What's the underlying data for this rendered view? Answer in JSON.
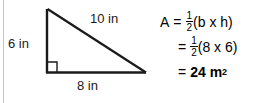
{
  "figure": {
    "shape_name": "right-triangle",
    "labels": {
      "height": "6 in",
      "hypotenuse": "10 in",
      "base": "8 in"
    },
    "right_angle_marker": "right-angle-square"
  },
  "formula": {
    "line1": {
      "lhs": "A",
      "equals": "=",
      "fraction_numerator": "1",
      "fraction_denominator": "2",
      "expression": "(b x h)"
    },
    "line2": {
      "equals": "=",
      "fraction_numerator": "1",
      "fraction_denominator": "2",
      "expression": "(8 x 6)"
    },
    "line3": {
      "equals": "=",
      "value": "24 m",
      "exponent": "2"
    }
  },
  "colors": {
    "ink": "#000000",
    "rule": "#c9c9c9",
    "background": "#ffffff"
  }
}
